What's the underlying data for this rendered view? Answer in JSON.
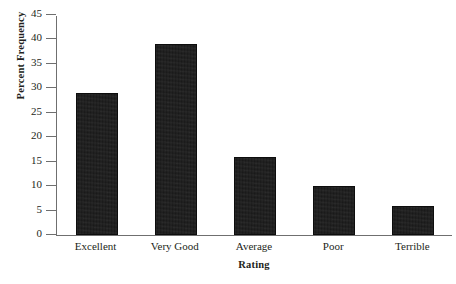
{
  "chart_data": {
    "type": "bar",
    "title": "",
    "categories": [
      "Excellent",
      "Very Good",
      "Average",
      "Poor",
      "Terrible"
    ],
    "values": [
      29,
      39,
      16,
      10,
      6
    ],
    "xlabel": "Rating",
    "ylabel": "Percent Frequency",
    "ylim": [
      0,
      45
    ],
    "yticks": [
      0,
      5,
      10,
      15,
      20,
      25,
      30,
      35,
      40,
      45
    ],
    "ytick_labels": [
      "0",
      "5",
      "10",
      "15",
      "20",
      "25",
      "30",
      "35",
      "40",
      "45"
    ],
    "grid": false,
    "legend": null,
    "series": [
      {
        "name": "Percent Frequency",
        "values": [
          29,
          39,
          16,
          10,
          6
        ],
        "color": "#191919"
      }
    ],
    "axis_color": "#6f6f6f",
    "bar_color": "#191919"
  }
}
